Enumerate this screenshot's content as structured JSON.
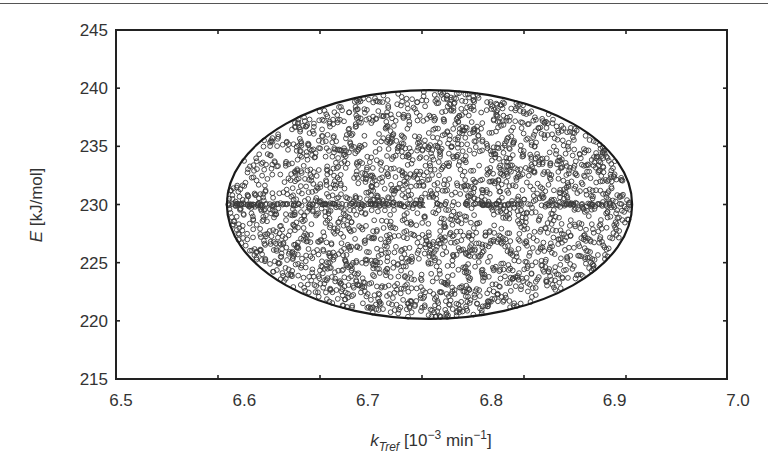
{
  "chart_data": {
    "type": "scatter",
    "title": "",
    "xlabel": "k_Tref [10^-3 min^-1]",
    "xlabel_parts": {
      "var": "k",
      "sub": "Tref",
      "pre": " [10",
      "sup1": "−3",
      "mid": " min",
      "sup2": "−1",
      "post": "]"
    },
    "ylabel": "E [kJ/mol]",
    "ylabel_parts": {
      "var": "E",
      "rest": " [kJ/mol]"
    },
    "xlim": [
      6.5,
      7.0
    ],
    "ylim": [
      215,
      245
    ],
    "xticks": [
      "6.5",
      "6.6",
      "6.7",
      "6.8",
      "6.9",
      "7.0"
    ],
    "yticks": [
      "245",
      "240",
      "235",
      "230",
      "225",
      "220",
      "215"
    ],
    "grid": false,
    "legend": null,
    "series": [
      {
        "name": "sampled parameter sets",
        "marker": "open-circle",
        "color": "#3a3a3a",
        "region": "ellipse",
        "count_approx": 2500,
        "x_center": 6.75,
        "y_center": 230,
        "x_halfwidth": 0.163,
        "y_halfwidth": 9.7
      },
      {
        "name": "confidence ellipse",
        "type": "line",
        "color": "#1a1a1a",
        "x_center": 6.75,
        "y_center": 230,
        "x_halfwidth": 0.163,
        "y_halfwidth": 9.7
      },
      {
        "name": "nominal estimate",
        "marker": "filled-circle-white",
        "x": [
          6.75
        ],
        "y": [
          230
        ]
      }
    ]
  }
}
